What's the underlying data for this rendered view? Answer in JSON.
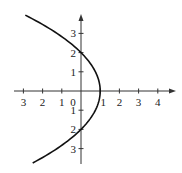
{
  "chart_data": {
    "type": "line",
    "title": "",
    "xlabel": "",
    "ylabel": "",
    "equation": "x = 1 - y^2/4",
    "x_ticks": [
      -3,
      -2,
      -1,
      0,
      1,
      2,
      3,
      4
    ],
    "x_tick_labels": [
      "3",
      "2",
      "1",
      "0",
      "1",
      "2",
      "3",
      "4"
    ],
    "y_ticks": [
      3,
      2,
      1,
      -1,
      -2,
      -3
    ],
    "y_tick_labels": [
      "3",
      "2",
      "1",
      "1",
      "2",
      "3"
    ],
    "xlim": [
      -3.5,
      4.9
    ],
    "ylim": [
      -3.8,
      4.0
    ],
    "grid": false,
    "legend": null,
    "series": [
      {
        "name": "parabola",
        "points": [
          {
            "x": -2.6,
            "y": 3.9
          },
          {
            "x": -1.25,
            "y": 3.0
          },
          {
            "x": 0,
            "y": 2
          },
          {
            "x": 0.75,
            "y": 1
          },
          {
            "x": 1,
            "y": 0
          },
          {
            "x": 0.75,
            "y": -1
          },
          {
            "x": 0,
            "y": -2
          },
          {
            "x": -1.25,
            "y": -3.0
          },
          {
            "x": -1.7,
            "y": -3.7
          }
        ]
      }
    ],
    "key_points": {
      "vertex": [
        1,
        0
      ],
      "y_intercepts": [
        2,
        -2
      ],
      "x_intercept": 1
    }
  }
}
